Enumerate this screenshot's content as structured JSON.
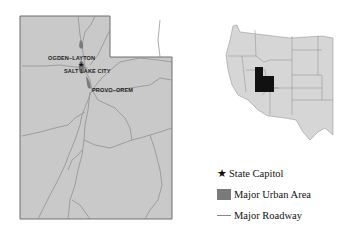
{
  "map": {
    "state": "Utah",
    "fill_color": "#c9c9c9",
    "border_color": "#6f6f6f",
    "road_color": "#8a8a8a",
    "urban_color": "#7a7a7a",
    "cities": [
      {
        "label": "OGDEN–LAYTON"
      },
      {
        "label": "SALT LAKE CITY"
      },
      {
        "label": "PROVO–OREM"
      }
    ]
  },
  "inset": {
    "region": "Western United States",
    "highlight": "Utah",
    "fill_color": "#d6d6d6",
    "highlight_color": "#111111"
  },
  "legend": {
    "items": [
      {
        "icon": "star-icon",
        "label": "State Capitol"
      },
      {
        "icon": "urban-area-swatch",
        "label": "Major Urban Area"
      },
      {
        "icon": "roadway-line",
        "label": "Major Roadway"
      }
    ]
  }
}
